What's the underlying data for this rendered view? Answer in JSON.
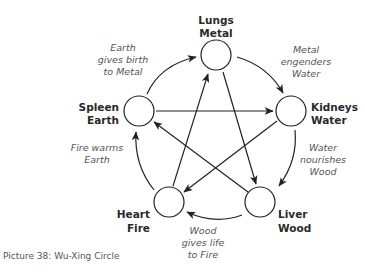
{
  "diagram": {
    "type": "wu-xing-cycle",
    "nodes": [
      {
        "id": "lungs",
        "organ": "Lungs",
        "element": "Metal"
      },
      {
        "id": "kidneys",
        "organ": "Kidneys",
        "element": "Water"
      },
      {
        "id": "liver",
        "organ": "Liver",
        "element": "Wood"
      },
      {
        "id": "heart",
        "organ": "Heart",
        "element": "Fire"
      },
      {
        "id": "spleen",
        "organ": "Spleen",
        "element": "Earth"
      }
    ],
    "generating_cycle": [
      {
        "from": "spleen",
        "to": "lungs",
        "line1": "Earth",
        "line2": "gives birth",
        "line3": "to Metal"
      },
      {
        "from": "lungs",
        "to": "kidneys",
        "line1": "Metal",
        "line2": "engenders",
        "line3": "Water"
      },
      {
        "from": "kidneys",
        "to": "liver",
        "line1": "Water",
        "line2": "nourishes",
        "line3": "Wood"
      },
      {
        "from": "liver",
        "to": "heart",
        "line1": "Wood",
        "line2": "gives life",
        "line3": "to Fire"
      },
      {
        "from": "heart",
        "to": "spleen",
        "line1": "Fire warms",
        "line2": "Earth"
      }
    ],
    "controlling_cycle": [
      {
        "from": "spleen",
        "to": "kidneys"
      },
      {
        "from": "kidneys",
        "to": "heart"
      },
      {
        "from": "heart",
        "to": "lungs"
      },
      {
        "from": "lungs",
        "to": "liver"
      },
      {
        "from": "liver",
        "to": "spleen"
      }
    ]
  },
  "caption": "Picture 38: Wu-Xing Circle",
  "colors": {
    "stroke": "#222222",
    "label": "#2a2a2a",
    "italic": "#555555"
  }
}
